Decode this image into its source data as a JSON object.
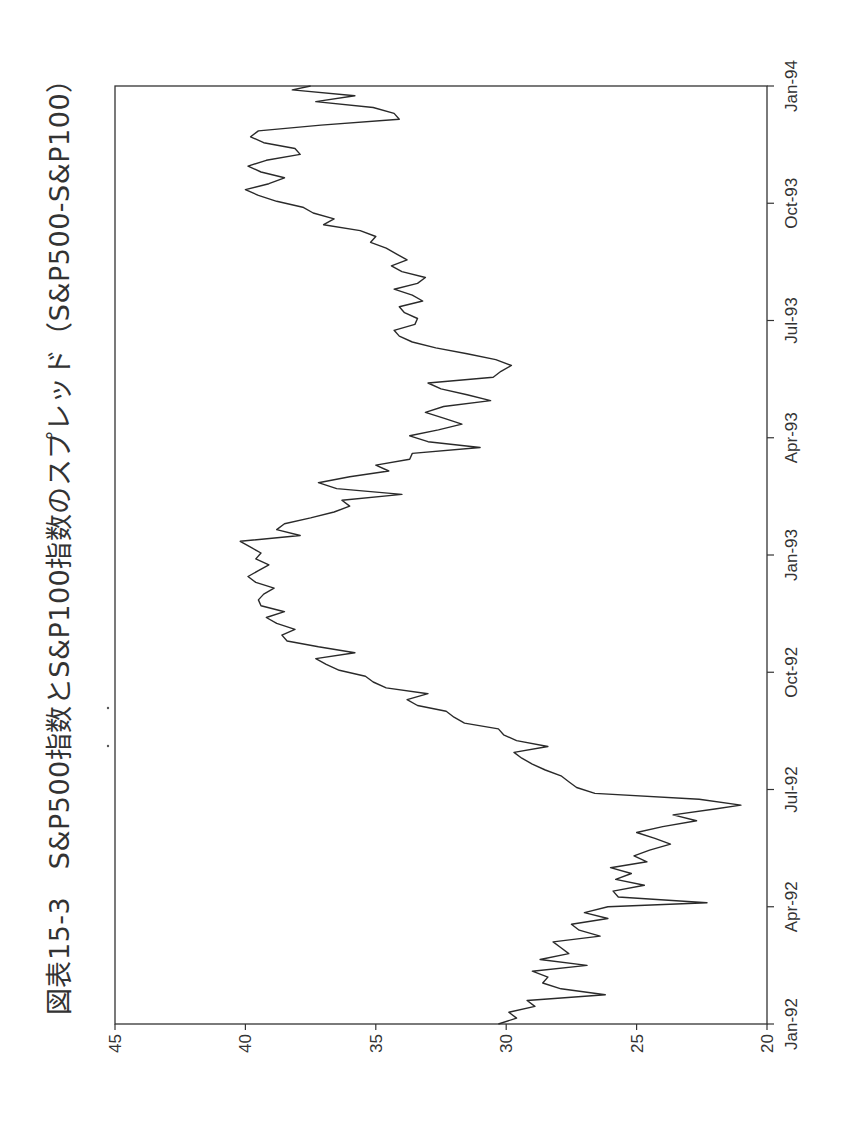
{
  "title": "図表15-3　S&P500指数とS&P100指数のスプレッド（S&P500-S&P100）",
  "chart_data": {
    "type": "line",
    "title": "図表15-3　S&P500指数とS&P100指数のスプレッド（S&P500-S&P100）",
    "xlabel": "",
    "ylabel": "",
    "orientation": "rotated 90° counter-clockwise on page",
    "ylim": [
      20,
      45
    ],
    "yticks": [
      20,
      25,
      30,
      35,
      40,
      45
    ],
    "xticks": [
      "Jan-92",
      "Apr-92",
      "Jul-92",
      "Oct-92",
      "Jan-93",
      "Apr-93",
      "Jul-93",
      "Oct-93",
      "Jan-94"
    ],
    "grid": false,
    "legend": null,
    "series": [
      {
        "name": "S&P500-S&P100",
        "x_months_since_jan92": [
          0,
          0.15,
          0.3,
          0.45,
          0.6,
          0.75,
          0.9,
          1.05,
          1.2,
          1.35,
          1.5,
          1.65,
          1.8,
          1.95,
          2.1,
          2.25,
          2.4,
          2.55,
          2.7,
          2.85,
          3.0,
          3.1,
          3.25,
          3.4,
          3.55,
          3.7,
          3.85,
          4.0,
          4.15,
          4.3,
          4.45,
          4.6,
          4.75,
          4.9,
          5.05,
          5.2,
          5.35,
          5.5,
          5.6,
          5.75,
          5.9,
          6.05,
          6.2,
          6.35,
          6.5,
          6.65,
          6.8,
          6.95,
          7.1,
          7.25,
          7.4,
          7.55,
          7.7,
          7.85,
          8.0,
          8.15,
          8.3,
          8.45,
          8.6,
          8.75,
          8.9,
          9.05,
          9.2,
          9.35,
          9.5,
          9.65,
          9.8,
          9.95,
          10.1,
          10.25,
          10.4,
          10.55,
          10.7,
          10.85,
          11.0,
          11.15,
          11.3,
          11.45,
          11.6,
          11.75,
          11.9,
          12.05,
          12.2,
          12.35,
          12.5,
          12.65,
          12.8,
          12.95,
          13.1,
          13.25,
          13.4,
          13.55,
          13.7,
          13.85,
          14.0,
          14.15,
          14.3,
          14.45,
          14.6,
          14.75,
          14.9,
          15.05,
          15.2,
          15.35,
          15.5,
          15.65,
          15.8,
          15.95,
          16.1,
          16.25,
          16.4,
          16.55,
          16.7,
          16.85,
          17.0,
          17.15,
          17.3,
          17.45,
          17.6,
          17.75,
          17.9,
          18.05,
          18.2,
          18.35,
          18.5,
          18.65,
          18.8,
          18.95,
          19.1,
          19.25,
          19.4,
          19.55,
          19.7,
          19.85,
          20.0,
          20.15,
          20.3,
          20.45,
          20.6,
          20.75,
          20.9,
          21.05,
          21.2,
          21.35,
          21.5,
          21.65,
          21.8,
          21.95,
          22.1,
          22.25,
          22.4,
          22.55,
          22.7,
          22.85,
          23.0,
          23.15,
          23.3,
          23.45,
          23.6,
          23.75,
          23.9,
          24.0
        ],
        "values": [
          30.3,
          29.6,
          29.9,
          28.9,
          29.2,
          26.2,
          27.9,
          28.6,
          28.4,
          29.0,
          26.9,
          28.7,
          27.6,
          27.9,
          28.2,
          26.4,
          27.2,
          27.5,
          26.1,
          27.0,
          26.1,
          22.3,
          25.7,
          25.9,
          24.7,
          25.8,
          25.2,
          26.0,
          24.6,
          25.1,
          24.5,
          23.7,
          24.3,
          25.0,
          24.0,
          22.7,
          23.6,
          22.0,
          21.0,
          22.6,
          26.6,
          27.3,
          27.6,
          27.9,
          28.5,
          29.0,
          29.4,
          29.7,
          28.4,
          29.6,
          30.1,
          30.3,
          31.6,
          32.0,
          32.3,
          33.4,
          33.8,
          33.0,
          34.6,
          35.1,
          35.4,
          36.4,
          36.9,
          37.3,
          35.8,
          37.2,
          38.4,
          38.6,
          38.1,
          38.8,
          39.2,
          38.5,
          39.4,
          39.5,
          39.3,
          38.9,
          39.6,
          39.9,
          39.5,
          39.1,
          39.6,
          39.4,
          39.8,
          40.2,
          37.9,
          38.8,
          38.5,
          37.5,
          36.6,
          36.0,
          36.3,
          34.0,
          36.5,
          37.2,
          36.0,
          34.5,
          35.0,
          33.7,
          33.6,
          31.0,
          33.0,
          33.7,
          32.6,
          31.7,
          32.4,
          33.1,
          32.4,
          30.6,
          31.5,
          32.5,
          33.0,
          30.5,
          30.2,
          29.8,
          30.4,
          31.5,
          32.7,
          33.6,
          34.1,
          34.3,
          33.5,
          33.4,
          33.9,
          34.1,
          33.2,
          33.6,
          34.3,
          33.4,
          33.1,
          34.0,
          34.4,
          33.8,
          34.2,
          34.6,
          35.2,
          35.0,
          35.6,
          37.0,
          36.6,
          37.4,
          37.8,
          38.8,
          39.5,
          40.0,
          39.1,
          38.5,
          39.4,
          39.9,
          39.2,
          37.9,
          38.1,
          39.3,
          39.8,
          39.5,
          37.1,
          34.1,
          34.3,
          35.1,
          37.3,
          35.8,
          38.2,
          37.5,
          37.2,
          35.5,
          36.0,
          35.6,
          35.4
        ]
      }
    ]
  },
  "axis": {
    "y_tick_labels": [
      "45",
      "40",
      "35",
      "30",
      "25",
      "20"
    ],
    "x_tick_labels": [
      "Jan-92",
      "Apr-92",
      "Jul-92",
      "Oct-92",
      "Jan-93",
      "Apr-93",
      "Jul-93",
      "Oct-93",
      "Jan-94"
    ]
  },
  "colors": {
    "line": "#2a2a2a",
    "axis": "#333333",
    "text": "#333333"
  }
}
